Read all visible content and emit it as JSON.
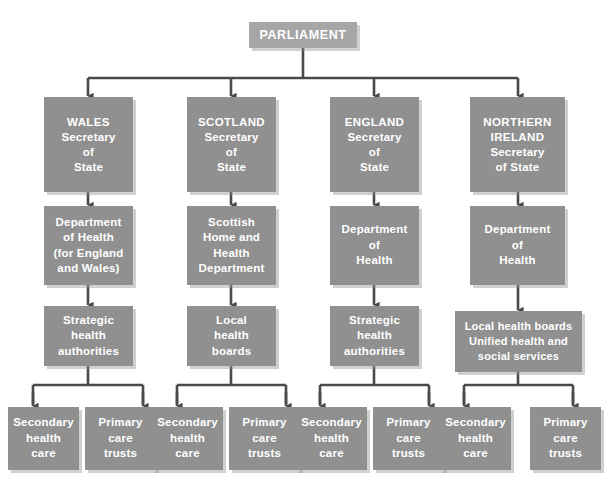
{
  "diagram": {
    "colors": {
      "background": "#ffffff",
      "node_fill": "#909090",
      "root_fill": "#a6a6a6",
      "node_text": "#ffffff",
      "connector": "#4a4a4a",
      "shadow": "#c8c8c8"
    },
    "root": {
      "id": "parliament",
      "label": "PARLIAMENT"
    },
    "columns": [
      {
        "id": "wales",
        "secretary": {
          "lines": [
            "WALES",
            "Secretary",
            "of",
            "State"
          ]
        },
        "department": {
          "lines": [
            "Department",
            "of Health",
            "(for England",
            "and Wales)"
          ]
        },
        "authority": {
          "lines": [
            "Strategic",
            "health",
            "authorities"
          ]
        },
        "services": [
          {
            "lines": [
              "Secondary",
              "health",
              "care"
            ]
          },
          {
            "lines": [
              "Primary",
              "care",
              "trusts"
            ]
          }
        ]
      },
      {
        "id": "scotland",
        "secretary": {
          "lines": [
            "SCOTLAND",
            "Secretary",
            "of",
            "State"
          ]
        },
        "department": {
          "lines": [
            "Scottish",
            "Home and",
            "Health",
            "Department"
          ]
        },
        "authority": {
          "lines": [
            "Local",
            "health",
            "boards"
          ]
        },
        "services": [
          {
            "lines": [
              "Secondary",
              "health",
              "care"
            ]
          },
          {
            "lines": [
              "Primary",
              "care",
              "trusts"
            ]
          }
        ]
      },
      {
        "id": "england",
        "secretary": {
          "lines": [
            "ENGLAND",
            "Secretary",
            "of",
            "State"
          ]
        },
        "department": {
          "lines": [
            "Department",
            "of",
            "Health"
          ]
        },
        "authority": {
          "lines": [
            "Strategic",
            "health",
            "authorities"
          ]
        },
        "services": [
          {
            "lines": [
              "Secondary",
              "health",
              "care"
            ]
          },
          {
            "lines": [
              "Primary",
              "care",
              "trusts"
            ]
          }
        ]
      },
      {
        "id": "northern-ireland",
        "secretary": {
          "lines": [
            "NORTHERN",
            "IRELAND",
            "Secretary",
            "of State"
          ]
        },
        "department": {
          "lines": [
            "Department",
            "of",
            "Health"
          ]
        },
        "authority": {
          "lines": [
            "Local health boards",
            "Unified health and",
            "social services"
          ]
        },
        "services": [
          {
            "lines": [
              "Secondary",
              "health",
              "care"
            ]
          },
          {
            "lines": [
              "Primary",
              "care",
              "trusts"
            ]
          }
        ]
      }
    ]
  }
}
